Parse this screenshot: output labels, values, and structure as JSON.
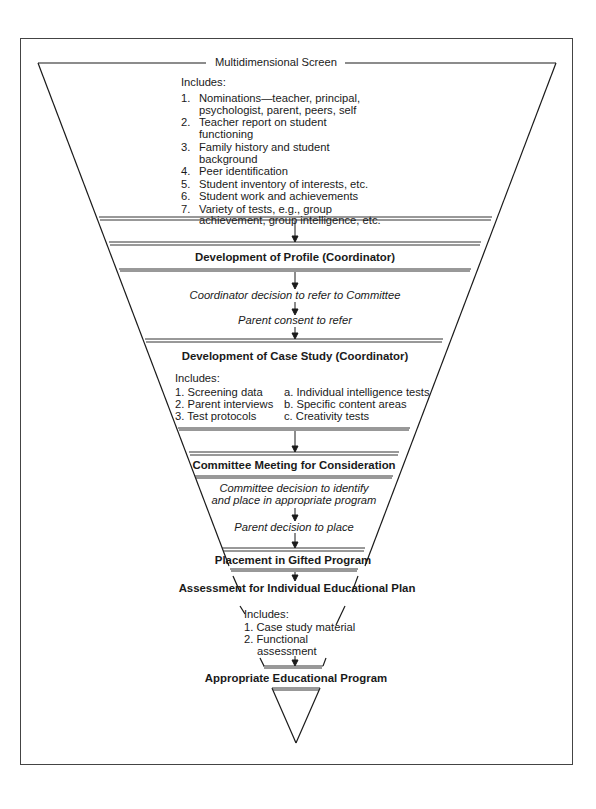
{
  "screen": {
    "title": "Multidimensional Screen",
    "includes_label": "Includes:",
    "items": [
      {
        "num": "1.",
        "lines": [
          "Nominations—teacher, principal,",
          "psychologist, parent, peers, self"
        ]
      },
      {
        "num": "2.",
        "lines": [
          "Teacher report on student",
          "functioning"
        ]
      },
      {
        "num": "3.",
        "lines": [
          "Family history and student",
          "background"
        ]
      },
      {
        "num": "4.",
        "lines": [
          "Peer identification"
        ]
      },
      {
        "num": "5.",
        "lines": [
          "Student inventory of interests, etc."
        ]
      },
      {
        "num": "6.",
        "lines": [
          "Student work and achievements"
        ]
      },
      {
        "num": "7.",
        "lines": [
          "Variety of tests, e.g., group",
          "achievement, group intelligence, etc."
        ]
      }
    ]
  },
  "profile": {
    "title": "Development of Profile (Coordinator)"
  },
  "referral": {
    "step1": "Coordinator decision to refer to Committee",
    "step2": "Parent consent to refer"
  },
  "case_study": {
    "title": "Development of Case Study (Coordinator)",
    "includes_label": "Includes:",
    "left": [
      "1. Screening data",
      "2. Parent interviews",
      "3. Test protocols"
    ],
    "right": [
      "a. Individual intelligence tests",
      "b. Specific content areas",
      "c. Creativity tests"
    ]
  },
  "committee": {
    "title": "Committee Meeting for Consideration",
    "decision_lines": [
      "Committee decision to identify",
      "and place in appropriate program"
    ],
    "parent_decision": "Parent decision to place"
  },
  "placement": {
    "title": "Placement in Gifted Program"
  },
  "assessment": {
    "title": "Assessment for Individual Educational Plan",
    "includes_label": "Includes:",
    "items": [
      "1. Case study material",
      "2. Functional",
      "assessment"
    ]
  },
  "program": {
    "title": "Appropriate Educational Program"
  },
  "colors": {
    "line": "#1a1a1a",
    "frame": "#444444",
    "band": "#555555"
  }
}
